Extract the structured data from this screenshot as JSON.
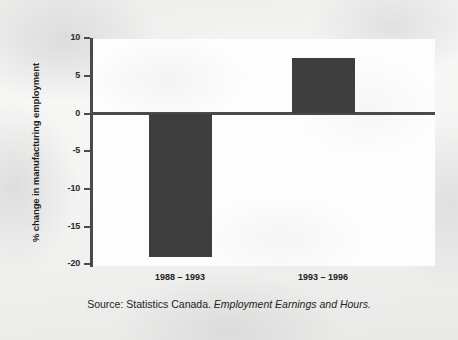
{
  "chart_data": {
    "type": "bar",
    "title": "",
    "subtitle": "",
    "xlabel": "",
    "ylabel": "% change in manufacturing employment",
    "categories": [
      "1988 – 1993",
      "1993 – 1996"
    ],
    "values": [
      -19.0,
      7.4
    ],
    "series": [
      {
        "name": "% change in manufacturing employment",
        "values": [
          -19.0,
          7.4
        ]
      }
    ],
    "ylim": [
      -20,
      10
    ],
    "yticks": [
      10,
      5,
      0,
      -5,
      -10,
      -15,
      -20
    ],
    "ytick_labels": [
      "10",
      "5",
      "0",
      "-5",
      "-10",
      "-15",
      "-20"
    ],
    "grid": false,
    "legend": false,
    "legend_position": "none",
    "bar_color": "#3e3e3e",
    "axis_color": "#4a4a4a",
    "zero_line": 0,
    "annotations": []
  },
  "axis": {
    "title": "% change in manufacturing employment",
    "ticks": [
      {
        "label": "10",
        "value": 10
      },
      {
        "label": "5",
        "value": 5
      },
      {
        "label": "0",
        "value": 0
      },
      {
        "label": "-5",
        "value": -5
      },
      {
        "label": "-10",
        "value": -10
      },
      {
        "label": "-15",
        "value": -15
      },
      {
        "label": "-20",
        "value": -20
      }
    ]
  },
  "bars": [
    {
      "category": "1988 – 1993",
      "value": -19.0
    },
    {
      "category": "1993 – 1996",
      "value": 7.4
    }
  ],
  "source": {
    "prefix": "Source: Statistics Canada. ",
    "publication": "Employment Earnings and Hours."
  }
}
